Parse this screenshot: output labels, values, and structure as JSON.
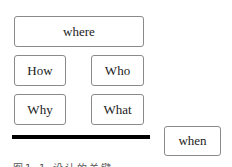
{
  "diagram": {
    "boxes": {
      "where": "where",
      "how": "How",
      "who": "Who",
      "why": "Why",
      "what": "What",
      "when": "when"
    },
    "caption": "图1-1  设计的关键"
  },
  "colors": {
    "border": "#8a8a8a",
    "bar": "#000000",
    "text": "#222222"
  }
}
